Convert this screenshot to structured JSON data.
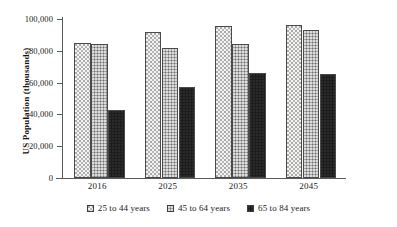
{
  "chart_data": {
    "type": "bar",
    "title": "",
    "xlabel": "",
    "ylabel": "US Population (thousands)",
    "categories": [
      "2016",
      "2025",
      "2035",
      "2045"
    ],
    "series": [
      {
        "name": "25 to 44 years",
        "values": [
          85000,
          92000,
          95500,
          96000
        ],
        "fill": "light-dotted"
      },
      {
        "name": "45 to 64 years",
        "values": [
          84000,
          81500,
          84500,
          93000
        ],
        "fill": "gray-dotted"
      },
      {
        "name": "65 to 84 years",
        "values": [
          43000,
          57500,
          66000,
          65500
        ],
        "fill": "solid-black"
      }
    ],
    "ylim": [
      0,
      100000
    ],
    "ytick_labels": [
      "100,000",
      "80,000",
      "60,000",
      "40,000",
      "20,000",
      "0"
    ],
    "ytick_values": [
      100000,
      80000,
      60000,
      40000,
      20000,
      0
    ],
    "grid": false,
    "legend_position": "bottom"
  },
  "legend": {
    "items": [
      {
        "label": "25 to 44 years",
        "swatch": "light-dotted-swatch"
      },
      {
        "label": "45 to 64 years",
        "swatch": "gray-dotted-swatch"
      },
      {
        "label": "65 to 84 years",
        "swatch": "solid-black-swatch"
      }
    ]
  },
  "colors": {
    "axis": "#5a5a5a",
    "text": "#1a1a1a",
    "series_light": "#f4f4f2",
    "series_gray": "#a6a6a6",
    "series_black": "#1d1d1d"
  }
}
